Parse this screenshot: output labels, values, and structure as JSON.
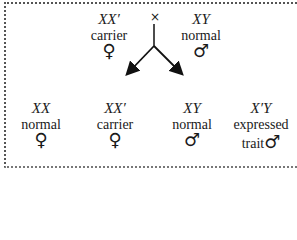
{
  "cross_symbol": "×",
  "parents": [
    {
      "genotype": "XX′",
      "label": "carrier",
      "sex_symbol": "♀"
    },
    {
      "genotype": "XY",
      "label": "normal",
      "sex_symbol": "♂"
    }
  ],
  "offspring": [
    {
      "genotype": "XX",
      "label": "normal",
      "sex_symbol": "♀"
    },
    {
      "genotype": "XX′",
      "label": "carrier",
      "sex_symbol": "♀"
    },
    {
      "genotype": "XY",
      "label": "normal",
      "sex_symbol": "♂"
    },
    {
      "genotype": "X′Y",
      "label": "expressed",
      "label2": "trait",
      "sex_symbol": "♂"
    }
  ]
}
